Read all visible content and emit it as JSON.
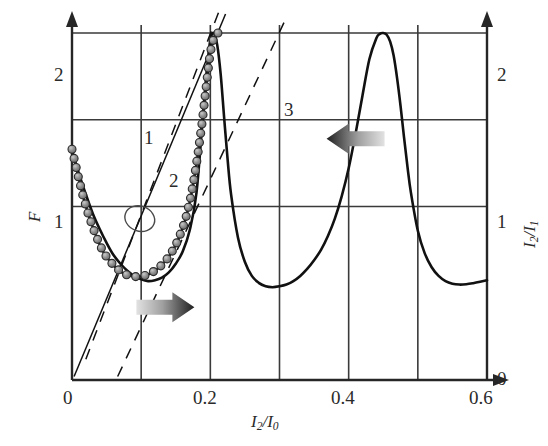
{
  "chart_data": {
    "type": "line",
    "title": "",
    "xlabel": "I2/I0",
    "ylabel_left": "F",
    "ylabel_right": "I2/I1",
    "xlim": [
      0,
      0.6
    ],
    "ylim_left": [
      0,
      2
    ],
    "ylim_right": [
      0,
      2
    ],
    "xticks": [
      0,
      0.2,
      0.4,
      0.6
    ],
    "xtick_labels": [
      "0",
      "0.2",
      "0.4",
      "0.6"
    ],
    "yticks_left": [
      1,
      2
    ],
    "ytick_labels_left": [
      "1",
      "2"
    ],
    "yticks_right": [
      0,
      1,
      2
    ],
    "ytick_labels_right": [
      "0",
      "1",
      "2"
    ],
    "grid": true,
    "grid_x": [
      0.1,
      0.2,
      0.3,
      0.4,
      0.5
    ],
    "grid_y": [
      1.0,
      1.5,
      2.0
    ],
    "legend": "none",
    "series": [
      {
        "name": "transmission-resonance-curve",
        "type": "line",
        "axis": "right",
        "markers": false,
        "x": [
          0.0,
          0.01,
          0.02,
          0.03,
          0.04,
          0.05,
          0.06,
          0.07,
          0.08,
          0.09,
          0.1,
          0.11,
          0.12,
          0.13,
          0.14,
          0.15,
          0.16,
          0.17,
          0.18,
          0.19,
          0.195,
          0.2,
          0.205,
          0.21,
          0.215,
          0.22,
          0.225,
          0.23,
          0.24,
          0.25,
          0.26,
          0.27,
          0.28,
          0.29,
          0.3,
          0.31,
          0.32,
          0.33,
          0.34,
          0.35,
          0.36,
          0.37,
          0.38,
          0.39,
          0.4,
          0.41,
          0.42,
          0.43,
          0.44,
          0.445,
          0.45,
          0.455,
          0.46,
          0.465,
          0.47,
          0.475,
          0.48,
          0.485,
          0.49,
          0.5,
          0.51,
          0.52,
          0.53,
          0.54,
          0.55,
          0.56,
          0.57,
          0.58,
          0.59,
          0.6
        ],
        "y": [
          1.32,
          1.19,
          1.07,
          0.96,
          0.87,
          0.79,
          0.72,
          0.67,
          0.63,
          0.6,
          0.58,
          0.57,
          0.575,
          0.59,
          0.62,
          0.67,
          0.74,
          0.86,
          1.08,
          1.56,
          1.79,
          1.96,
          2.0,
          1.93,
          1.76,
          1.51,
          1.27,
          1.07,
          0.82,
          0.68,
          0.6,
          0.56,
          0.54,
          0.535,
          0.54,
          0.55,
          0.57,
          0.6,
          0.64,
          0.69,
          0.75,
          0.83,
          0.93,
          1.06,
          1.22,
          1.42,
          1.64,
          1.85,
          1.97,
          1.995,
          2.0,
          1.99,
          1.95,
          1.87,
          1.74,
          1.58,
          1.4,
          1.23,
          1.08,
          0.86,
          0.73,
          0.65,
          0.6,
          0.57,
          0.555,
          0.55,
          0.552,
          0.558,
          0.566,
          0.575
        ]
      },
      {
        "name": "finesse-curve-with-markers",
        "type": "line",
        "axis": "left",
        "markers": true,
        "marker_style": "filled-circle-gray",
        "x": [
          0.0,
          0.008,
          0.016,
          0.024,
          0.032,
          0.04,
          0.048,
          0.056,
          0.064,
          0.072,
          0.08,
          0.088,
          0.096,
          0.104,
          0.112,
          0.12,
          0.128,
          0.136,
          0.144,
          0.152,
          0.16,
          0.166,
          0.172,
          0.178,
          0.183,
          0.188,
          0.192,
          0.196,
          0.199,
          0.202,
          0.205,
          0.207,
          0.209,
          0.211
        ],
        "y": [
          1.33,
          1.19,
          1.06,
          0.95,
          0.86,
          0.78,
          0.72,
          0.68,
          0.645,
          0.62,
          0.605,
          0.597,
          0.595,
          0.6,
          0.612,
          0.63,
          0.656,
          0.69,
          0.735,
          0.795,
          0.875,
          0.955,
          1.06,
          1.195,
          1.33,
          1.48,
          1.62,
          1.76,
          1.86,
          1.93,
          1.97,
          1.99,
          1.998,
          2.0
        ]
      },
      {
        "name": "dashed-line-1",
        "type": "line",
        "style": "dashed",
        "label": "1",
        "x": [
          0.02,
          0.212
        ],
        "y": [
          0.12,
          2.12
        ]
      },
      {
        "name": "solid-line-2",
        "type": "line",
        "style": "solid",
        "label": "2",
        "x": [
          0.003,
          0.222
        ],
        "y": [
          0.02,
          2.11
        ]
      },
      {
        "name": "dashed-line-3",
        "type": "line",
        "style": "dashed",
        "label": "3",
        "x": [
          0.066,
          0.31
        ],
        "y": [
          0.02,
          2.09
        ]
      }
    ],
    "annotations": [
      {
        "name": "curve-label-1",
        "text": "1",
        "x": 0.111,
        "y": 1.625
      },
      {
        "name": "curve-label-2",
        "text": "2",
        "x": 0.146,
        "y": 1.305
      },
      {
        "name": "curve-label-3",
        "text": "3",
        "x": 0.318,
        "y": 1.79
      },
      {
        "name": "ellipse-highlight",
        "shape": "ellipse",
        "cx": 0.098,
        "cy": 0.93,
        "rx": 0.022,
        "ry": 0.072,
        "rotation_deg": 20
      },
      {
        "name": "arrow-left-to-right-axis",
        "shape": "arrow",
        "direction": "left",
        "x": 0.41,
        "y": 1.39
      },
      {
        "name": "arrow-right-to-left-axis",
        "shape": "arrow",
        "direction": "right",
        "x": 0.135,
        "y": 0.42
      }
    ]
  },
  "axes": {
    "x_label": "I",
    "x_label_sub": "2",
    "x_label_den": "I",
    "x_label_den_sub": "0",
    "left_label": "F",
    "right_label": "I",
    "right_label_sub": "2",
    "right_label_den": "I",
    "right_label_den_sub": "1"
  },
  "ticks": {
    "x": [
      "0",
      "0.2",
      "0.4",
      "0.6"
    ],
    "y_left": [
      "1",
      "2"
    ],
    "y_right": [
      "0",
      "1",
      "2"
    ]
  },
  "labels": {
    "line1": "1",
    "line2": "2",
    "line3": "3"
  },
  "colors": {
    "axis": "#262626",
    "grid": "#3a3a3a",
    "curve": "#111111",
    "marker_fill": "#8f8f8f",
    "marker_edge": "#2b2b2b",
    "arrow_dark": "#2e2e2e",
    "arrow_light": "#d8d8d8",
    "background": "#ffffff"
  }
}
